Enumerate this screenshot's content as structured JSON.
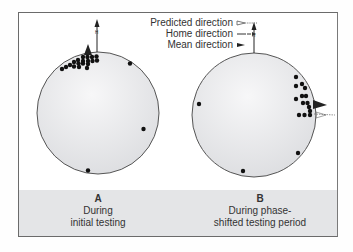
{
  "legend": {
    "items": [
      {
        "label": "Predicted direction",
        "symbol": "open-arrow-dotted"
      },
      {
        "label": "Home direction",
        "symbol": "dashed-arrow"
      },
      {
        "label": "Mean direction",
        "symbol": "filled-triangle"
      }
    ]
  },
  "home_marker": "H",
  "panels": [
    {
      "letter": "A",
      "caption_line1": "During",
      "caption_line2": "initial testing"
    },
    {
      "letter": "B",
      "caption_line1": "During phase-",
      "caption_line2": "shifted testing period"
    }
  ],
  "colors": {
    "frame": "#6b6b6b",
    "strip": "#e4e5e7",
    "circle_fill": "#e9eaec",
    "dot": "#111111"
  }
}
